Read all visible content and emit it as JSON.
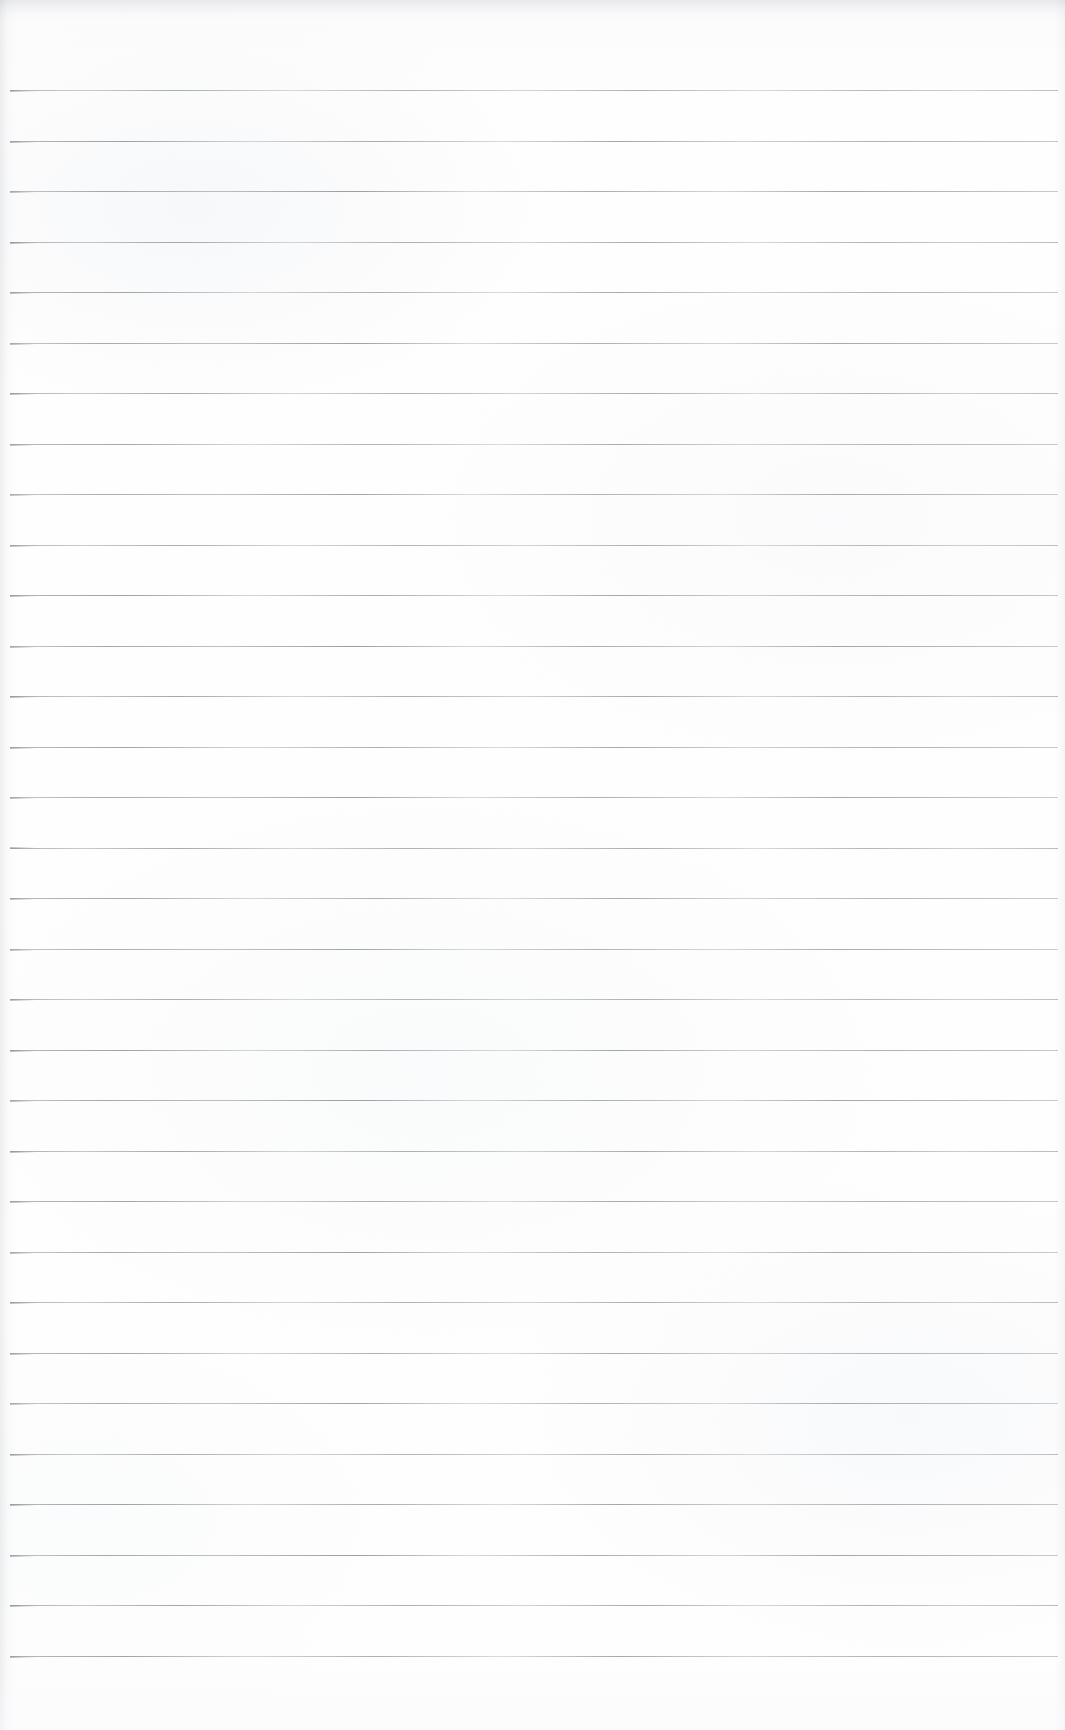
{
  "document": {
    "kind": "scanned-ruled-notebook-page",
    "title": "Blank Ruled Notebook Page",
    "orientation": "portrait",
    "page_width": 1065,
    "page_height": 1730,
    "content_text": "",
    "has_handwriting": false,
    "has_printed_text": false
  },
  "paper": {
    "background_color": "#fdfdfd",
    "tint": "neutral off-white",
    "texture": "light scanner grain with faint blotches",
    "top_edge_artifact_color": "#a0a3aa",
    "left_edge_shade_color": "#9699a0",
    "right_edge_shade_color": "#aaadb4"
  },
  "ruling": {
    "style": "horizontal ruled lines",
    "line_color": "#9a9da5",
    "line_thickness_px": 1,
    "line_count": 32,
    "first_line_y": 90,
    "line_spacing_px": 50.5,
    "line_start_x": 10,
    "line_end_x": 1058,
    "margin_line": "none",
    "top_margin_px": 90,
    "bottom_margin_px": 75,
    "lines_y": [
      90,
      140.5,
      191,
      241.5,
      292,
      342.5,
      393,
      443.5,
      494,
      544.5,
      595,
      645.5,
      696,
      746.5,
      797,
      847.5,
      898,
      948.5,
      999,
      1049.5,
      1100,
      1150.5,
      1201,
      1251.5,
      1302,
      1352.5,
      1403,
      1453.5,
      1504,
      1554.5,
      1605,
      1655.5
    ],
    "ink_variants": [
      "v1",
      "v2",
      "v3"
    ]
  }
}
